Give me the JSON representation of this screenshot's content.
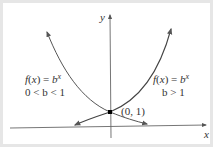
{
  "diagram": {
    "axes": {
      "x_label": "x",
      "y_label": "y"
    },
    "curves": [
      {
        "name": "decay",
        "label_line1": "f(x) = b",
        "exponent": "x",
        "label_line2": "0 < b < 1",
        "condition": "0 < b < 1"
      },
      {
        "name": "growth",
        "label_line1": "f(x) = b",
        "exponent": "x",
        "label_line2": "b > 1",
        "condition": "b > 1"
      }
    ],
    "intercept_point": {
      "label": "(0, 1)",
      "x": 0,
      "y": 1
    },
    "colors": {
      "curve": "#555555",
      "axis": "#666666",
      "point": "#000000",
      "text": "#333333",
      "border": "#e6e6e6",
      "background": "#ffffff"
    }
  }
}
